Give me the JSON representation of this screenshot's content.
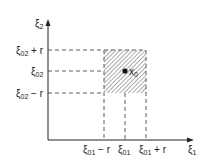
{
  "diagram": {
    "type": "2D square neighborhood plot",
    "axes": {
      "x_label": "ξ",
      "x_label_sub": "1",
      "y_label": "ξ",
      "y_label_sub": "2"
    },
    "y_ticks": [
      {
        "base": "ξ",
        "sub": "02",
        "suffix": " + r"
      },
      {
        "base": "ξ",
        "sub": "02",
        "suffix": ""
      },
      {
        "base": "ξ",
        "sub": "02",
        "suffix": " − r"
      }
    ],
    "x_ticks": [
      {
        "base": "ξ",
        "sub": "01",
        "suffix": " − r"
      },
      {
        "base": "ξ",
        "sub": "01",
        "suffix": ""
      },
      {
        "base": "ξ",
        "sub": "01",
        "suffix": " + r"
      }
    ],
    "point": {
      "base": "x",
      "sub": "0"
    },
    "region": "hatched square centered at x0 with half-width r",
    "colors": {
      "ink": "#222222",
      "hatch": "#555555",
      "background": "#ffffff"
    }
  }
}
